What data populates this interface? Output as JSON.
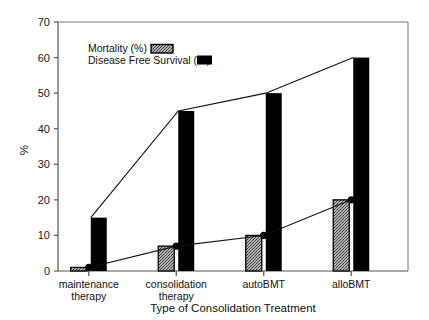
{
  "chart_data": {
    "type": "bar",
    "title": "",
    "xlabel": "Type of Consolidation Treatment",
    "ylabel": "%",
    "ylim": [
      0,
      70
    ],
    "yticks": [
      0,
      10,
      20,
      30,
      40,
      50,
      60,
      70
    ],
    "ytick_labels": [
      "0",
      "10",
      "20",
      "30",
      "40",
      "50",
      "60",
      "70"
    ],
    "grid": false,
    "legend_position": "upper left inside",
    "categories": [
      "maintenance therapy",
      "consolidation therapy",
      "autoBMT",
      "alloBMT"
    ],
    "category_lines": [
      [
        "maintenance",
        "therapy"
      ],
      [
        "consolidation",
        "therapy"
      ],
      [
        "autoBMT"
      ],
      [
        "alloBMT"
      ]
    ],
    "series": [
      {
        "name": "Mortality (%)",
        "values": [
          1,
          7,
          10,
          20
        ],
        "style": "stippled-bar-with-line-markers",
        "color": "#9a9a9a",
        "edge_color": "#000000"
      },
      {
        "name": "Disease Free Survival (%)",
        "values": [
          15,
          45,
          50,
          60
        ],
        "style": "solid-bar-with-line-markers",
        "color": "#000000",
        "edge_color": "#000000"
      }
    ]
  },
  "legend": {
    "entries": [
      {
        "label": "Mortality (%)",
        "swatch": "stippled-swatch"
      },
      {
        "label": "Disease Free Survival (%)",
        "swatch": "solid-black-swatch"
      }
    ]
  },
  "colors": {
    "axis": "#555555",
    "frame": "#777777",
    "bar_mortality": "#9a9a9a",
    "bar_dfs": "#000000",
    "line": "#111111",
    "marker": "#000000",
    "background": "#ffffff"
  }
}
